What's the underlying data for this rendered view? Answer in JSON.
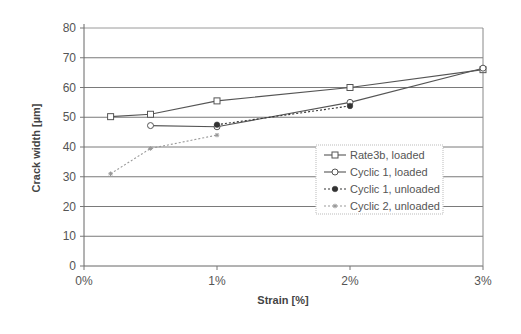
{
  "chart_data": {
    "type": "line",
    "title": "",
    "xlabel": "Strain [%]",
    "ylabel": "Crack width [µm]",
    "xlim": [
      0,
      3
    ],
    "ylim": [
      0,
      80
    ],
    "x_ticks": [
      "0%",
      "1%",
      "2%",
      "3%"
    ],
    "y_ticks": [
      "0",
      "10",
      "20",
      "30",
      "40",
      "50",
      "60",
      "70",
      "80"
    ],
    "grid": "horizontal",
    "legend_position": "inside-right-middle",
    "series": [
      {
        "name": "Rate3b, loaded",
        "marker": "open-square",
        "line": "solid",
        "color": "#555555",
        "x": [
          0.2,
          0.5,
          1.0,
          2.0,
          3.0
        ],
        "y": [
          50.2,
          51.0,
          55.5,
          60.0,
          66.0
        ]
      },
      {
        "name": "Cyclic 1, loaded",
        "marker": "open-circle",
        "line": "solid",
        "color": "#555555",
        "x": [
          0.5,
          1.0,
          2.0,
          3.0
        ],
        "y": [
          47.2,
          46.8,
          55.0,
          66.5
        ]
      },
      {
        "name": "Cyclic 1, unloaded",
        "marker": "filled-circle",
        "line": "dotted",
        "color": "#333333",
        "x": [
          1.0,
          2.0
        ],
        "y": [
          47.5,
          53.8
        ]
      },
      {
        "name": "Cyclic 2, unloaded",
        "marker": "small-star",
        "line": "dotted",
        "color": "#999999",
        "x": [
          0.2,
          0.5,
          1.0
        ],
        "y": [
          31.0,
          39.5,
          44.0
        ]
      }
    ]
  }
}
